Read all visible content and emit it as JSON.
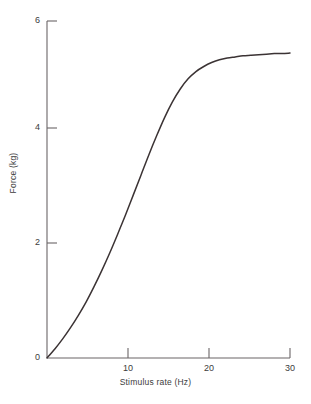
{
  "chart_data": {
    "type": "line",
    "title": "",
    "xlabel": "Stimulus rate (Hz)",
    "ylabel": "Force (kg)",
    "xlim": [
      0,
      31
    ],
    "ylim": [
      0,
      6
    ],
    "xticks": [
      10,
      20,
      30
    ],
    "yticks": [
      0,
      2,
      4,
      6
    ],
    "xtick_labels": [
      "10",
      "20",
      "30"
    ],
    "ytick_labels": [
      "0",
      "2",
      "4",
      "6"
    ],
    "grid": false,
    "legend": null,
    "line_color": "#3b3334",
    "series": [
      {
        "name": "force-frequency curve",
        "x": [
          0,
          1,
          2,
          3,
          4,
          5,
          6,
          7,
          8,
          9,
          10,
          11,
          12,
          13,
          14,
          15,
          16,
          17,
          18,
          19,
          20,
          21,
          22,
          23,
          24,
          25,
          26,
          27,
          28,
          29,
          30,
          31
        ],
        "y": [
          0.0,
          0.16,
          0.34,
          0.54,
          0.76,
          1.0,
          1.27,
          1.56,
          1.87,
          2.2,
          2.54,
          2.9,
          3.26,
          3.62,
          3.96,
          4.28,
          4.56,
          4.79,
          4.97,
          5.1,
          5.19,
          5.26,
          5.31,
          5.34,
          5.36,
          5.38,
          5.39,
          5.4,
          5.41,
          5.42,
          5.42,
          5.43
        ]
      }
    ],
    "annotations": []
  },
  "axis_labels": {
    "x_title": "Stimulus rate (Hz)",
    "y_title": "Force (kg)"
  }
}
